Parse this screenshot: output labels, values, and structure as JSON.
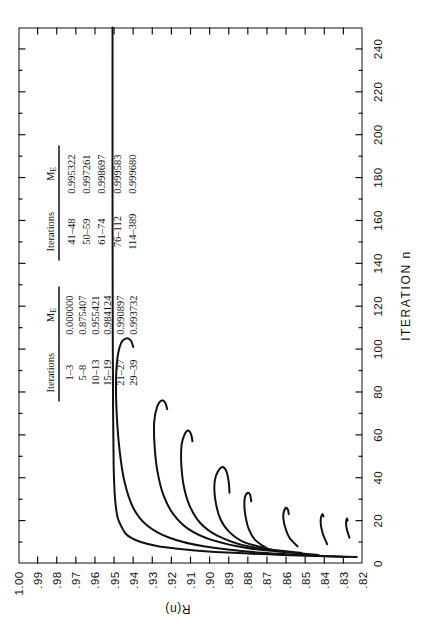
{
  "figure": {
    "x_axis_title": "ITERATION n",
    "y_axis_title": "R(n)"
  },
  "tables": [
    {
      "name": "iterations-me-table-left",
      "columns": [
        "Iterations",
        "M",
        "E"
      ],
      "header_iterations": "Iterations",
      "header_me": "M",
      "header_me_sub": "E",
      "rows": [
        {
          "iterations": "1–3",
          "me": "0.000000"
        },
        {
          "iterations": "5–8",
          "me": "0.875407"
        },
        {
          "iterations": "10–13",
          "me": "0.955421"
        },
        {
          "iterations": "15–19",
          "me": "0.984124"
        },
        {
          "iterations": "21–27",
          "me": "0.990897"
        },
        {
          "iterations": "29–39",
          "me": "0.993732"
        }
      ]
    },
    {
      "name": "iterations-me-table-right",
      "header_iterations": "Iterations",
      "header_me": "M",
      "header_me_sub": "E",
      "rows": [
        {
          "iterations": "41–48",
          "me": "0.995322"
        },
        {
          "iterations": "50–59",
          "me": "0.997261"
        },
        {
          "iterations": "61–74",
          "me": "0.998697"
        },
        {
          "iterations": "76–112",
          "me": "0.999583"
        },
        {
          "iterations": "114–389",
          "me": "0.999680"
        }
      ]
    }
  ],
  "chart_data": {
    "type": "line",
    "title": "",
    "xlabel": "ITERATION n",
    "ylabel": "R(n)",
    "xlim": [
      0,
      250
    ],
    "ylim": [
      0.82,
      1.0
    ],
    "grid": false,
    "legend": false,
    "xticks": [
      0,
      20,
      40,
      60,
      80,
      100,
      120,
      140,
      160,
      180,
      200,
      220,
      240
    ],
    "xtick_labels": [
      "0",
      "20",
      "40",
      "60",
      "80",
      "100",
      "120",
      "140",
      "160",
      "180",
      "200",
      "220",
      "240"
    ],
    "x_minor_tick_step": 10,
    "yticks": [
      1.0,
      0.99,
      0.98,
      0.97,
      0.96,
      0.95,
      0.94,
      0.93,
      0.92,
      0.91,
      0.9,
      0.89,
      0.88,
      0.87,
      0.86,
      0.85,
      0.84,
      0.83,
      0.82
    ],
    "ytick_labels": [
      "1.00",
      ".99",
      ".98",
      ".97",
      ".96",
      ".95",
      ".94",
      ".93",
      ".92",
      ".91",
      ".90",
      ".89",
      ".88",
      ".87",
      ".86",
      ".85",
      ".84",
      ".83",
      ".82"
    ],
    "ytick_labels_shown": [
      "1.00",
      ".99",
      ".98",
      ".97",
      ".96",
      ".95",
      ".94",
      ".93",
      ".92",
      ".91",
      ".90",
      ".89",
      ".88",
      ".87",
      ".86",
      ".85",
      ".84",
      ".83",
      ".82"
    ],
    "series": [
      {
        "name": "branch-1",
        "comment": "Main upper branch: rises from ~0.823 at n=3 steeply to ~0.950 then flat to n=250",
        "points": [
          [
            3,
            0.823
          ],
          [
            4,
            0.862
          ],
          [
            5,
            0.888
          ],
          [
            6,
            0.906
          ],
          [
            7,
            0.918
          ],
          [
            8,
            0.927
          ],
          [
            10,
            0.936
          ],
          [
            12,
            0.941
          ],
          [
            14,
            0.944
          ],
          [
            17,
            0.946
          ],
          [
            21,
            0.948
          ],
          [
            26,
            0.949
          ],
          [
            33,
            0.9497
          ],
          [
            45,
            0.9502
          ],
          [
            70,
            0.9505
          ],
          [
            110,
            0.9507
          ],
          [
            170,
            0.9508
          ],
          [
            250,
            0.9508
          ]
        ]
      },
      {
        "name": "branch-2",
        "comment": "Second branch, turning hook near n=105",
        "points": [
          [
            3,
            0.828
          ],
          [
            5,
            0.873
          ],
          [
            8,
            0.903
          ],
          [
            12,
            0.921
          ],
          [
            18,
            0.933
          ],
          [
            26,
            0.94
          ],
          [
            38,
            0.9445
          ],
          [
            52,
            0.947
          ],
          [
            68,
            0.9485
          ],
          [
            84,
            0.949
          ],
          [
            96,
            0.9482
          ],
          [
            103,
            0.9462
          ],
          [
            105,
            0.9435
          ],
          [
            104,
            0.9412
          ],
          [
            101,
            0.94
          ]
        ]
      },
      {
        "name": "branch-3",
        "comment": "Third branch, hook near n=75",
        "points": [
          [
            4,
            0.843
          ],
          [
            7,
            0.879
          ],
          [
            11,
            0.899
          ],
          [
            16,
            0.911
          ],
          [
            23,
            0.919
          ],
          [
            32,
            0.9242
          ],
          [
            43,
            0.9273
          ],
          [
            55,
            0.9288
          ],
          [
            66,
            0.929
          ],
          [
            73,
            0.9275
          ],
          [
            76,
            0.9252
          ],
          [
            75,
            0.9232
          ],
          [
            72,
            0.9222
          ]
        ]
      },
      {
        "name": "branch-4",
        "comment": "Fourth branch, hook near n=61",
        "points": [
          [
            5,
            0.852
          ],
          [
            8,
            0.88
          ],
          [
            13,
            0.896
          ],
          [
            19,
            0.905
          ],
          [
            27,
            0.9105
          ],
          [
            36,
            0.9135
          ],
          [
            46,
            0.9148
          ],
          [
            55,
            0.9147
          ],
          [
            60,
            0.9132
          ],
          [
            62,
            0.9112
          ],
          [
            60,
            0.9096
          ],
          [
            57,
            0.909
          ]
        ]
      },
      {
        "name": "branch-5",
        "comment": "Fifth branch, broad hook ending near n=43",
        "points": [
          [
            6,
            0.866
          ],
          [
            10,
            0.882
          ],
          [
            15,
            0.89
          ],
          [
            21,
            0.8945
          ],
          [
            28,
            0.8967
          ],
          [
            34,
            0.8975
          ],
          [
            39,
            0.8972
          ],
          [
            43,
            0.8956
          ],
          [
            45,
            0.8932
          ],
          [
            43,
            0.8912
          ],
          [
            38,
            0.89
          ],
          [
            33,
            0.8896
          ]
        ]
      },
      {
        "name": "branch-6",
        "comment": "Sixth branch, gentle slope, terminates near n=30",
        "points": [
          [
            7,
            0.87
          ],
          [
            11,
            0.8762
          ],
          [
            16,
            0.8795
          ],
          [
            22,
            0.8812
          ],
          [
            27,
            0.8818
          ],
          [
            31,
            0.8815
          ],
          [
            33,
            0.88
          ],
          [
            32,
            0.8788
          ],
          [
            29,
            0.8782
          ]
        ]
      },
      {
        "name": "branch-7",
        "comment": "Seventh branch terminating near n=25",
        "points": [
          [
            8,
            0.854
          ],
          [
            12,
            0.8582
          ],
          [
            17,
            0.8605
          ],
          [
            21,
            0.8614
          ],
          [
            24,
            0.8612
          ],
          [
            26,
            0.86
          ],
          [
            25,
            0.859
          ],
          [
            23,
            0.8586
          ]
        ]
      },
      {
        "name": "branch-8",
        "comment": "Eighth, nearly flat short segment",
        "points": [
          [
            9,
            0.8385
          ],
          [
            14,
            0.8408
          ],
          [
            18,
            0.8418
          ],
          [
            21,
            0.8418
          ],
          [
            23,
            0.841
          ],
          [
            22,
            0.8404
          ]
        ]
      },
      {
        "name": "branch-9",
        "comment": "Lowest short segment",
        "points": [
          [
            12,
            0.8268
          ],
          [
            16,
            0.8282
          ],
          [
            19,
            0.8286
          ],
          [
            21,
            0.8282
          ],
          [
            20,
            0.8278
          ]
        ]
      }
    ]
  }
}
